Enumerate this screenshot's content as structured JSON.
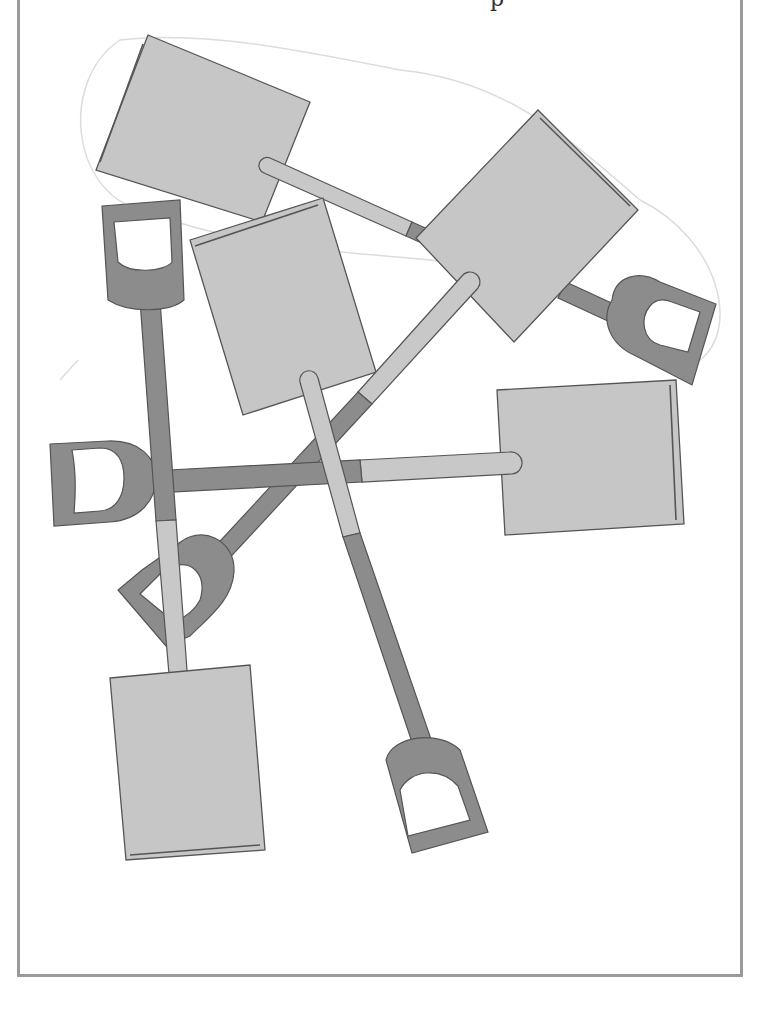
{
  "page": {
    "cut_off_heading": "p"
  },
  "colors": {
    "blade": "#c6c6c6",
    "handle_dark": "#8c8c8c",
    "outline": "#555555",
    "frame_border": "#9a9a9a",
    "sketch_line": "#dcdcdc"
  },
  "shovels": [
    {
      "id": 1,
      "label": "top-left shovel",
      "blade_color": "light",
      "handle_color": "light"
    },
    {
      "id": 2,
      "label": "top-right shovel",
      "blade_color": "light",
      "handle_color": "dark"
    },
    {
      "id": 3,
      "label": "middle shovel",
      "blade_color": "light",
      "handle_color": "dark"
    },
    {
      "id": 4,
      "label": "right shovel",
      "blade_color": "light",
      "handle_color": "dark"
    },
    {
      "id": 5,
      "label": "bottom-left shovel",
      "blade_color": "light",
      "handle_color": "dark"
    },
    {
      "id": 6,
      "label": "diagonal shovel",
      "blade_color": "light",
      "handle_color": "dark"
    }
  ]
}
